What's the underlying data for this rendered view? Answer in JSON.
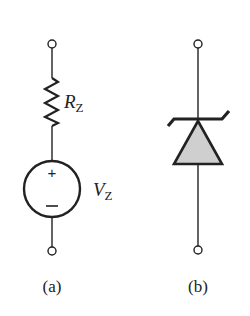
{
  "figure": {
    "colors": {
      "stroke": "#222222",
      "diode_fill": "#cfcfcf",
      "background": "#ffffff"
    },
    "panel_a": {
      "caption": "(a)",
      "resistor": {
        "symbol": "R",
        "subscript": "Z"
      },
      "voltage_source": {
        "symbol": "V",
        "subscript": "Z",
        "plus_sign": "+",
        "minus_sign": "−"
      },
      "terminals": [
        "top-terminal",
        "bottom-terminal"
      ]
    },
    "panel_b": {
      "caption": "(b)",
      "component": "zener-diode",
      "terminals": [
        "top-terminal",
        "bottom-terminal"
      ]
    }
  }
}
